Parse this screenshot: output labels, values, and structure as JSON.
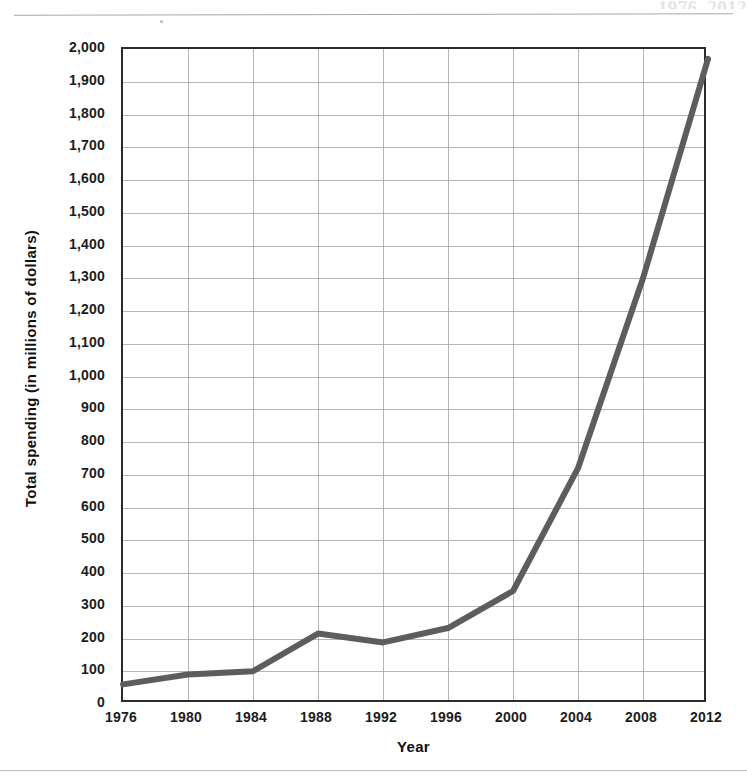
{
  "page": {
    "title_fragment": "1976–2012",
    "rule_top": true,
    "rule_bottom": true
  },
  "chart_data": {
    "type": "line",
    "title": "",
    "xlabel": "Year",
    "ylabel": "Total spending (in millions of dollars)",
    "x": [
      1976,
      1980,
      1984,
      1988,
      1992,
      1996,
      2000,
      2004,
      2008,
      2012
    ],
    "categories": [
      "1976",
      "1980",
      "1984",
      "1988",
      "1992",
      "1996",
      "2000",
      "2004",
      "2008",
      "2012"
    ],
    "values": [
      60,
      90,
      100,
      215,
      188,
      232,
      345,
      720,
      1300,
      1970
    ],
    "series": [
      {
        "name": "Total spending",
        "values": [
          60,
          90,
          100,
          215,
          188,
          232,
          345,
          720,
          1300,
          1970
        ]
      }
    ],
    "xlim": [
      1976,
      2012
    ],
    "ylim": [
      0,
      2000
    ],
    "ytick_step": 100,
    "xtick_step": 4,
    "yticks": [
      "0",
      "100",
      "200",
      "300",
      "400",
      "500",
      "600",
      "700",
      "800",
      "900",
      "1,000",
      "1,100",
      "1,200",
      "1,300",
      "1,400",
      "1,500",
      "1,600",
      "1,700",
      "1,800",
      "1,900",
      "2,000"
    ],
    "ytick_values": [
      0,
      100,
      200,
      300,
      400,
      500,
      600,
      700,
      800,
      900,
      1000,
      1100,
      1200,
      1300,
      1400,
      1500,
      1600,
      1700,
      1800,
      1900,
      2000
    ],
    "xticks": [
      "1976",
      "1980",
      "1984",
      "1988",
      "1992",
      "1996",
      "2000",
      "2004",
      "2008",
      "2012"
    ],
    "grid": true,
    "grid_horizontal": true,
    "grid_vertical": true,
    "legend": false,
    "legend_position": "none",
    "line_color": "#5d5d5d",
    "line_width": 6,
    "grid_color": "#9e9e9e",
    "axis_color": "#2b2b2b",
    "text_color": "#1c1c1c",
    "background": "#ffffff",
    "markers": false,
    "annotations": []
  }
}
